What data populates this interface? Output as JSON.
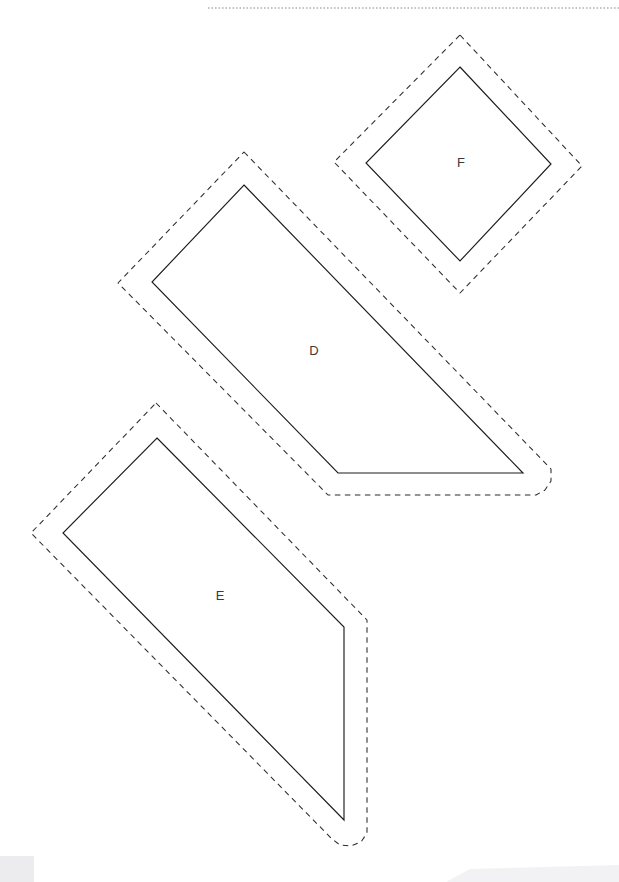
{
  "document": {
    "kind": "sewing-pattern-sheet",
    "background_color": "#ffffff",
    "width": 619,
    "height": 882
  },
  "guides": {
    "top_rule": {
      "name": "page-top-dotted-rule",
      "color": "#7a7a8a",
      "x1": 208,
      "y1": 8,
      "x2": 619,
      "y2": 8
    }
  },
  "style": {
    "cut_line_color": "#1c1c1c",
    "seam_line_color": "#2b2b2b",
    "label_color": "#3a3a3a",
    "seam_dash": "5.5 4.5"
  },
  "pieces": [
    {
      "id": "piece-f",
      "label": "F",
      "label_x": 461,
      "label_y": 164,
      "cut_path": "M 460 67 L 551 164 L 460 261 L 366 163 Z",
      "seam_path": "M 460 35 L 582 166 L 460 293 L 334 162 Z"
    },
    {
      "id": "piece-d",
      "label": "D",
      "label_x": 314,
      "label_y": 352,
      "cut_path": "M 244 185 L 523 473 L 338 473 L 152 282 Z",
      "seam_path": "M 244 152 L 551 469 L 551 481 L 545 490 L 536 495 L 328 495 L 118 283 Z"
    },
    {
      "id": "piece-e",
      "label": "E",
      "label_x": 220,
      "label_y": 597,
      "cut_path": "M 157 438 L 344 627 L 344 820 L 63 533 Z",
      "seam_path": "M 156 403 L 367 620 L 367 833 L 361 842 L 351 846 L 340 845 L 332 839 L 31 533 Z"
    }
  ],
  "artifacts": [
    {
      "id": "smudge-bottom-left",
      "x": 0,
      "y": 855,
      "width": 36,
      "height": 27,
      "color": "#d9d9de"
    },
    {
      "id": "smudge-bottom-right",
      "x": 440,
      "y": 866,
      "width": 179,
      "height": 16,
      "color": "#e4e4e8"
    }
  ]
}
